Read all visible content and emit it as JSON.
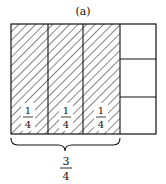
{
  "title": "(a)",
  "diagram": {
    "columns": 4,
    "shaded_columns": 3,
    "unshaded_column_rows": 3,
    "shaded_labels": [
      {
        "num": "1",
        "den": "4"
      },
      {
        "num": "1",
        "den": "4"
      },
      {
        "num": "1",
        "den": "4"
      }
    ],
    "total": {
      "num": "3",
      "den": "4"
    },
    "colors": {
      "stroke": "#111111",
      "hatch": "#222222",
      "background": "#ffffff"
    }
  }
}
